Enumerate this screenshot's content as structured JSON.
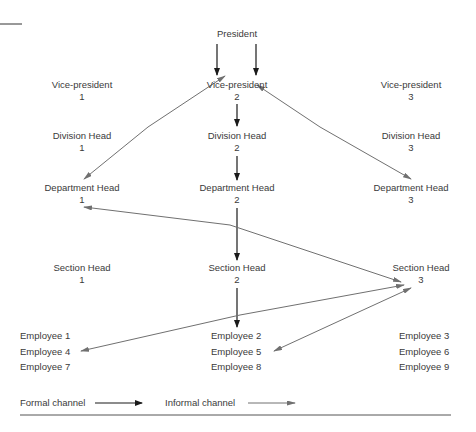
{
  "nodes": {
    "president": {
      "label": "President"
    },
    "vp1": {
      "label": "Vice-president",
      "num": "1"
    },
    "vp2": {
      "label": "Vice-president",
      "num": "2"
    },
    "vp3": {
      "label": "Vice-president",
      "num": "3"
    },
    "div1": {
      "label": "Division Head",
      "num": "1"
    },
    "div2": {
      "label": "Division Head",
      "num": "2"
    },
    "div3": {
      "label": "Division Head",
      "num": "3"
    },
    "dep1": {
      "label": "Department Head",
      "num": "1"
    },
    "dep2": {
      "label": "Department Head",
      "num": "2"
    },
    "dep3": {
      "label": "Department Head",
      "num": "3"
    },
    "sec1": {
      "label": "Section Head",
      "num": "1"
    },
    "sec2": {
      "label": "Section Head",
      "num": "2"
    },
    "sec3": {
      "label": "Section Head",
      "num": "3"
    }
  },
  "employees": {
    "col1": [
      "Employee 1",
      "Employee 4",
      "Employee 7"
    ],
    "col2": [
      "Employee 2",
      "Employee 5",
      "Employee 8"
    ],
    "col3": [
      "Employee 3",
      "Employee 6",
      "Employee 9"
    ]
  },
  "legend": {
    "formal": "Formal channel",
    "informal": "Informal channel"
  },
  "colors": {
    "formal": "#1a1a1a",
    "informal": "#707070",
    "text": "#3a3a3a"
  }
}
